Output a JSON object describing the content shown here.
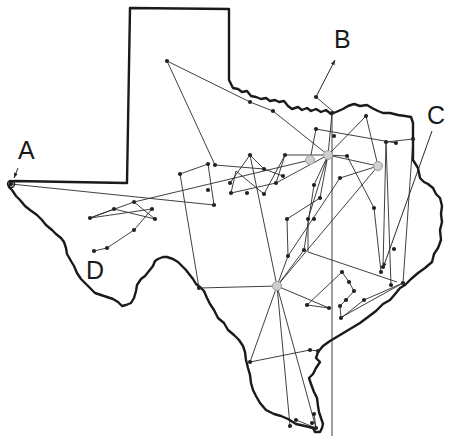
{
  "diagram": {
    "title": "",
    "colors": {
      "border": "#1a1a1a",
      "edge": "#2a2a2a",
      "node": "#222222",
      "hub_ring": "#9a9a9a",
      "background": "#ffffff"
    },
    "labels": [
      {
        "id": "A",
        "text": "A",
        "x": 18,
        "y": 138
      },
      {
        "id": "B",
        "text": "B",
        "x": 334,
        "y": 27
      },
      {
        "id": "C",
        "text": "C",
        "x": 427,
        "y": 103
      },
      {
        "id": "D",
        "text": "D",
        "x": 86,
        "y": 258
      }
    ],
    "pointers": [
      {
        "label": "A",
        "from": [
          18,
          168
        ],
        "to": [
          14,
          178
        ]
      },
      {
        "label": "B",
        "from": [
          316,
          97
        ],
        "to": [
          335,
          60
        ]
      },
      {
        "label": "C",
        "from": [
          432,
          131
        ],
        "to": [
          383,
          268
        ]
      }
    ],
    "hubs": [
      {
        "name": "hub-north",
        "x": 328,
        "y": 155
      },
      {
        "name": "hub-north-west",
        "x": 310,
        "y": 160
      },
      {
        "name": "hub-south",
        "x": 277,
        "y": 286
      },
      {
        "name": "hub-east",
        "x": 378,
        "y": 166
      }
    ],
    "nodes": [
      [
        11,
        184
      ],
      [
        167,
        61
      ],
      [
        250,
        102
      ],
      [
        273,
        111
      ],
      [
        316,
        97
      ],
      [
        332,
        113
      ],
      [
        366,
        116
      ],
      [
        316,
        129
      ],
      [
        334,
        136
      ],
      [
        386,
        142
      ],
      [
        396,
        143
      ],
      [
        413,
        139
      ],
      [
        347,
        156
      ],
      [
        285,
        155
      ],
      [
        250,
        155
      ],
      [
        215,
        165
      ],
      [
        264,
        169
      ],
      [
        283,
        176
      ],
      [
        230,
        183
      ],
      [
        276,
        183
      ],
      [
        247,
        193
      ],
      [
        264,
        194
      ],
      [
        231,
        193
      ],
      [
        208,
        190
      ],
      [
        180,
        174
      ],
      [
        208,
        164
      ],
      [
        214,
        205
      ],
      [
        134,
        202
      ],
      [
        114,
        209
      ],
      [
        152,
        209
      ],
      [
        155,
        219
      ],
      [
        90,
        218
      ],
      [
        134,
        230
      ],
      [
        107,
        248
      ],
      [
        94,
        251
      ],
      [
        340,
        178
      ],
      [
        314,
        185
      ],
      [
        320,
        198
      ],
      [
        314,
        219
      ],
      [
        308,
        219
      ],
      [
        304,
        250
      ],
      [
        287,
        219
      ],
      [
        288,
        256
      ],
      [
        374,
        208
      ],
      [
        381,
        272
      ],
      [
        383,
        267
      ],
      [
        394,
        249
      ],
      [
        391,
        285
      ],
      [
        403,
        283
      ],
      [
        199,
        288
      ],
      [
        342,
        272
      ],
      [
        349,
        282
      ],
      [
        354,
        291
      ],
      [
        346,
        300
      ],
      [
        340,
        306
      ],
      [
        364,
        300
      ],
      [
        341,
        318
      ],
      [
        307,
        305
      ],
      [
        329,
        308
      ],
      [
        310,
        350
      ],
      [
        318,
        351
      ],
      [
        250,
        362
      ],
      [
        290,
        426
      ],
      [
        296,
        420
      ],
      [
        312,
        423
      ],
      [
        316,
        428
      ],
      [
        314,
        414
      ]
    ],
    "edges": [
      [
        [
          11,
          184
        ],
        [
          214,
          205
        ]
      ],
      [
        [
          167,
          61
        ],
        [
          250,
          102
        ]
      ],
      [
        [
          250,
          102
        ],
        [
          273,
          111
        ]
      ],
      [
        [
          273,
          111
        ],
        [
          328,
          155
        ]
      ],
      [
        [
          167,
          61
        ],
        [
          215,
          165
        ]
      ],
      [
        [
          215,
          165
        ],
        [
          264,
          169
        ]
      ],
      [
        [
          316,
          97
        ],
        [
          335,
          113
        ]
      ],
      [
        [
          328,
          155
        ],
        [
          332,
          113
        ]
      ],
      [
        [
          332,
          113
        ],
        [
          332,
          436
        ]
      ],
      [
        [
          316,
          129
        ],
        [
          396,
          143
        ]
      ],
      [
        [
          316,
          129
        ],
        [
          310,
          160
        ]
      ],
      [
        [
          386,
          142
        ],
        [
          413,
          139
        ]
      ],
      [
        [
          386,
          142
        ],
        [
          391,
          285
        ]
      ],
      [
        [
          413,
          139
        ],
        [
          403,
          283
        ]
      ],
      [
        [
          386,
          142
        ],
        [
          383,
          267
        ]
      ],
      [
        [
          366,
          116
        ],
        [
          328,
          155
        ]
      ],
      [
        [
          366,
          116
        ],
        [
          378,
          166
        ]
      ],
      [
        [
          328,
          155
        ],
        [
          378,
          166
        ]
      ],
      [
        [
          347,
          156
        ],
        [
          374,
          208
        ]
      ],
      [
        [
          374,
          208
        ],
        [
          381,
          272
        ]
      ],
      [
        [
          347,
          156
        ],
        [
          328,
          155
        ]
      ],
      [
        [
          378,
          166
        ],
        [
          340,
          178
        ]
      ],
      [
        [
          340,
          178
        ],
        [
          288,
          256
        ]
      ],
      [
        [
          378,
          166
        ],
        [
          277,
          286
        ]
      ],
      [
        [
          328,
          155
        ],
        [
          285,
          155
        ]
      ],
      [
        [
          310,
          160
        ],
        [
          134,
          202
        ]
      ],
      [
        [
          328,
          155
        ],
        [
          276,
          183
        ]
      ],
      [
        [
          276,
          183
        ],
        [
          231,
          193
        ]
      ],
      [
        [
          231,
          193
        ],
        [
          236,
          171
        ]
      ],
      [
        [
          236,
          171
        ],
        [
          264,
          194
        ]
      ],
      [
        [
          250,
          155
        ],
        [
          264,
          169
        ]
      ],
      [
        [
          250,
          155
        ],
        [
          230,
          183
        ]
      ],
      [
        [
          264,
          169
        ],
        [
          283,
          176
        ]
      ],
      [
        [
          285,
          155
        ],
        [
          276,
          183
        ]
      ],
      [
        [
          285,
          155
        ],
        [
          264,
          194
        ]
      ],
      [
        [
          208,
          164
        ],
        [
          214,
          205
        ]
      ],
      [
        [
          208,
          164
        ],
        [
          180,
          174
        ]
      ],
      [
        [
          180,
          174
        ],
        [
          199,
          288
        ]
      ],
      [
        [
          250,
          155
        ],
        [
          277,
          286
        ]
      ],
      [
        [
          328,
          155
        ],
        [
          314,
          185
        ]
      ],
      [
        [
          314,
          185
        ],
        [
          304,
          250
        ]
      ],
      [
        [
          304,
          250
        ],
        [
          277,
          286
        ]
      ],
      [
        [
          328,
          155
        ],
        [
          320,
          198
        ]
      ],
      [
        [
          320,
          198
        ],
        [
          287,
          219
        ]
      ],
      [
        [
          287,
          219
        ],
        [
          288,
          256
        ]
      ],
      [
        [
          288,
          256
        ],
        [
          277,
          286
        ]
      ],
      [
        [
          328,
          155
        ],
        [
          308,
          219
        ]
      ],
      [
        [
          308,
          219
        ],
        [
          308,
          252
        ]
      ],
      [
        [
          308,
          252
        ],
        [
          397,
          282
        ]
      ],
      [
        [
          199,
          288
        ],
        [
          277,
          286
        ]
      ],
      [
        [
          277,
          286
        ],
        [
          329,
          308
        ]
      ],
      [
        [
          329,
          308
        ],
        [
          307,
          305
        ]
      ],
      [
        [
          307,
          305
        ],
        [
          342,
          272
        ]
      ],
      [
        [
          342,
          272
        ],
        [
          349,
          282
        ]
      ],
      [
        [
          349,
          282
        ],
        [
          354,
          291
        ]
      ],
      [
        [
          354,
          291
        ],
        [
          346,
          300
        ]
      ],
      [
        [
          346,
          300
        ],
        [
          340,
          306
        ]
      ],
      [
        [
          340,
          306
        ],
        [
          341,
          318
        ]
      ],
      [
        [
          341,
          318
        ],
        [
          364,
          300
        ]
      ],
      [
        [
          364,
          300
        ],
        [
          403,
          283
        ]
      ],
      [
        [
          277,
          286
        ],
        [
          250,
          362
        ]
      ],
      [
        [
          250,
          362
        ],
        [
          310,
          350
        ]
      ],
      [
        [
          310,
          350
        ],
        [
          318,
          351
        ]
      ],
      [
        [
          277,
          286
        ],
        [
          316,
          428
        ]
      ],
      [
        [
          277,
          286
        ],
        [
          290,
          426
        ]
      ],
      [
        [
          296,
          420
        ],
        [
          316,
          428
        ]
      ],
      [
        [
          314,
          414
        ],
        [
          316,
          428
        ]
      ],
      [
        [
          403,
          283
        ],
        [
          340,
          318
        ]
      ],
      [
        [
          134,
          202
        ],
        [
          90,
          218
        ]
      ],
      [
        [
          90,
          218
        ],
        [
          152,
          209
        ]
      ],
      [
        [
          134,
          202
        ],
        [
          155,
          219
        ]
      ],
      [
        [
          114,
          209
        ],
        [
          90,
          218
        ]
      ],
      [
        [
          114,
          209
        ],
        [
          155,
          219
        ]
      ],
      [
        [
          152,
          209
        ],
        [
          134,
          230
        ]
      ],
      [
        [
          134,
          230
        ],
        [
          107,
          248
        ]
      ],
      [
        [
          107,
          248
        ],
        [
          94,
          251
        ]
      ]
    ]
  }
}
